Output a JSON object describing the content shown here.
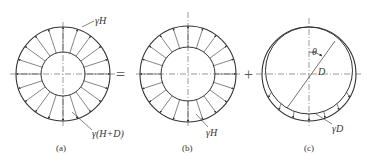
{
  "figure": {
    "panels": [
      {
        "id": "a",
        "caption": "(a)",
        "labels": {
          "outer": "γH",
          "inner": "γ(H+D)"
        }
      },
      {
        "id": "b",
        "caption": "(b)",
        "labels": {
          "outer": "γH"
        }
      },
      {
        "id": "c",
        "caption": "(c)",
        "labels": {
          "angle": "θ",
          "diameter": "D",
          "load": "γD"
        }
      }
    ],
    "operators": {
      "equals": "=",
      "plus": "+"
    },
    "colors": {
      "line": "#333333",
      "axis": "#555555"
    }
  }
}
